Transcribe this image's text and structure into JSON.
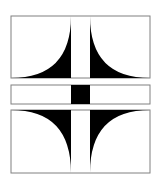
{
  "figure": {
    "colors": {
      "fill": "#000000",
      "stroke": "#808080",
      "background": "#ffffff"
    },
    "panels": [
      {
        "name": "top-panel",
        "x": 11,
        "y": 16,
        "w": 139,
        "h": 62
      },
      {
        "name": "middle-strip",
        "x": 11,
        "y": 85,
        "w": 139,
        "h": 19
      },
      {
        "name": "bottom-panel",
        "x": 11,
        "y": 110,
        "w": 139,
        "h": 63
      }
    ],
    "center_bar": {
      "x": 71,
      "w": 19
    }
  }
}
